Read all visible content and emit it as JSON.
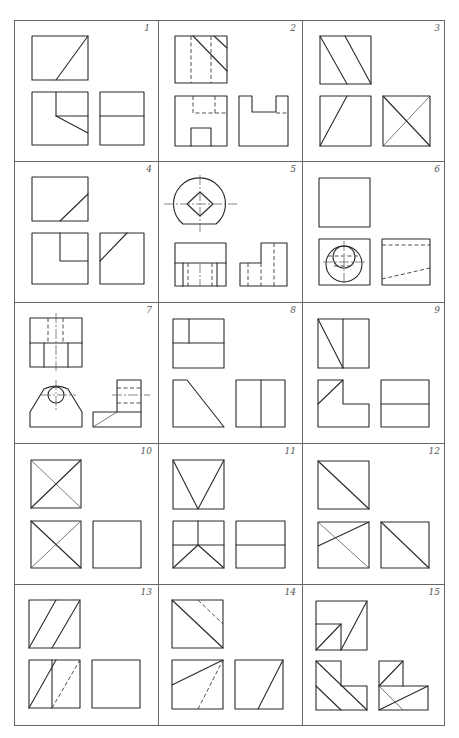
{
  "sheet": {
    "title": "Orthographic projection exercises",
    "columns": 3,
    "rows": 5,
    "line_color": "#2a2a2a",
    "frame_color": "#666666",
    "background": "#ffffff"
  },
  "problems": [
    {
      "number": "1",
      "views": [
        "front-view",
        "top-view",
        "side-view"
      ],
      "hidden_lines": false
    },
    {
      "number": "2",
      "views": [
        "front-view",
        "top-view",
        "side-view"
      ],
      "hidden_lines": true
    },
    {
      "number": "3",
      "views": [
        "front-view",
        "top-view",
        "side-view"
      ],
      "hidden_lines": true
    },
    {
      "number": "4",
      "views": [
        "front-view",
        "top-view",
        "side-view"
      ],
      "hidden_lines": false
    },
    {
      "number": "5",
      "views": [
        "front-view",
        "top-view",
        "side-view"
      ],
      "hidden_lines": true
    },
    {
      "number": "6",
      "views": [
        "front-view",
        "top-view",
        "side-view"
      ],
      "hidden_lines": true
    },
    {
      "number": "7",
      "views": [
        "front-view",
        "top-view",
        "side-view"
      ],
      "hidden_lines": true
    },
    {
      "number": "8",
      "views": [
        "front-view",
        "top-view",
        "side-view"
      ],
      "hidden_lines": false
    },
    {
      "number": "9",
      "views": [
        "front-view",
        "top-view",
        "side-view"
      ],
      "hidden_lines": false
    },
    {
      "number": "10",
      "views": [
        "front-view",
        "top-view",
        "side-view"
      ],
      "hidden_lines": true
    },
    {
      "number": "11",
      "views": [
        "front-view",
        "top-view",
        "side-view"
      ],
      "hidden_lines": false
    },
    {
      "number": "12",
      "views": [
        "front-view",
        "top-view",
        "side-view"
      ],
      "hidden_lines": true
    },
    {
      "number": "13",
      "views": [
        "front-view",
        "top-view",
        "side-view"
      ],
      "hidden_lines": true
    },
    {
      "number": "14",
      "views": [
        "front-view",
        "top-view",
        "side-view"
      ],
      "hidden_lines": true
    },
    {
      "number": "15",
      "views": [
        "front-view",
        "top-view",
        "side-view"
      ],
      "hidden_lines": true
    }
  ]
}
